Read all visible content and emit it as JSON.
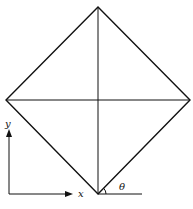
{
  "diagram": {
    "stroke_color": "#111111",
    "background": "#ffffff",
    "vertices": {
      "top": [
        98,
        7
      ],
      "left": [
        6,
        100
      ],
      "right": [
        190,
        100
      ],
      "bottom": [
        98,
        194
      ]
    },
    "labels": {
      "y_axis": "y",
      "x_axis": "x",
      "angle": "θ"
    },
    "axes": {
      "origin": [
        9,
        194
      ],
      "y_end": [
        9,
        131
      ],
      "x_end": [
        72,
        194
      ]
    },
    "reference_line": {
      "from": [
        98,
        194
      ],
      "to": [
        142,
        194
      ]
    }
  }
}
